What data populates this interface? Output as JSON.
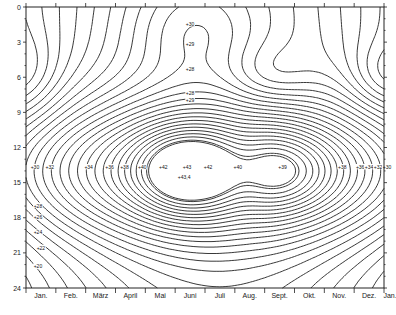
{
  "chart_data": {
    "type": "heatmap",
    "subtype": "isopleth contour plot",
    "title": "",
    "xlabel": "",
    "ylabel": "",
    "x_tick_labels": [
      "Jan.",
      "Feb.",
      "März",
      "April",
      "Mai",
      "Juni",
      "Juli",
      "Aug.",
      "Sept.",
      "Okt.",
      "Nov.",
      "Dez.",
      "Jan."
    ],
    "y_tick_labels": [
      "0",
      "3",
      "6",
      "9",
      "12",
      "15",
      "18",
      "21",
      "24"
    ],
    "ylim": [
      0,
      24
    ],
    "y_inverted": true,
    "grid": false,
    "contour_labels": [
      {
        "text": "+30",
        "month_pos": 5.5,
        "hour": 1.5
      },
      {
        "text": "+29",
        "month_pos": 5.5,
        "hour": 3.2
      },
      {
        "text": "+28",
        "month_pos": 5.5,
        "hour": 5.3
      },
      {
        "text": "+28",
        "month_pos": 5.5,
        "hour": 7.4
      },
      {
        "text": "+29",
        "month_pos": 5.5,
        "hour": 8.0
      },
      {
        "text": "+30",
        "month_pos": 0.3,
        "hour": 13.7
      },
      {
        "text": "+32",
        "month_pos": 0.8,
        "hour": 13.7
      },
      {
        "text": "+34",
        "month_pos": 2.1,
        "hour": 13.7
      },
      {
        "text": "+36",
        "month_pos": 2.8,
        "hour": 13.7
      },
      {
        "text": "+38",
        "month_pos": 3.3,
        "hour": 13.7
      },
      {
        "text": "+40",
        "month_pos": 3.9,
        "hour": 13.7
      },
      {
        "text": "+42",
        "month_pos": 4.6,
        "hour": 13.7
      },
      {
        "text": "+43",
        "month_pos": 5.4,
        "hour": 13.7
      },
      {
        "text": "+43,4",
        "month_pos": 5.3,
        "hour": 14.6
      },
      {
        "text": "+42",
        "month_pos": 6.1,
        "hour": 13.7
      },
      {
        "text": "+40",
        "month_pos": 7.1,
        "hour": 13.7
      },
      {
        "text": "+39",
        "month_pos": 8.6,
        "hour": 13.7
      },
      {
        "text": "+38",
        "month_pos": 10.6,
        "hour": 13.7
      },
      {
        "text": "+36",
        "month_pos": 11.2,
        "hour": 13.7
      },
      {
        "text": "+34",
        "month_pos": 11.5,
        "hour": 13.7
      },
      {
        "text": "+32",
        "month_pos": 11.8,
        "hour": 13.7
      },
      {
        "text": "+30",
        "month_pos": 12.1,
        "hour": 13.7
      },
      {
        "text": "+28",
        "month_pos": 0.4,
        "hour": 17.0
      },
      {
        "text": "+26",
        "month_pos": 0.4,
        "hour": 18.0
      },
      {
        "text": "+24",
        "month_pos": 0.4,
        "hour": 19.3
      },
      {
        "text": "+22",
        "month_pos": 0.5,
        "hour": 20.6
      },
      {
        "text": "+20",
        "month_pos": 0.4,
        "hour": 22.2
      }
    ],
    "extrema": [
      {
        "type": "maximum",
        "value": 43.4,
        "month_pos": 5.3,
        "hour": 14
      },
      {
        "type": "secondary maximum",
        "value": 39,
        "month_pos": 8.6,
        "hour": 14
      },
      {
        "type": "closed minimum",
        "month_pos": 8.2,
        "hour": 6
      },
      {
        "type": "closed minimum",
        "month_pos": 12.6,
        "hour": 6
      }
    ],
    "legend": null
  }
}
